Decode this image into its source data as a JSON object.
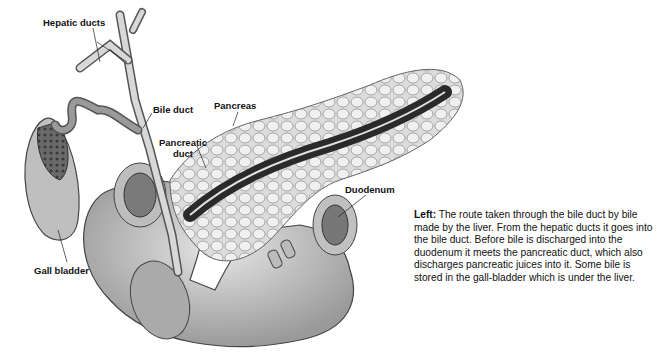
{
  "labels": {
    "hepatic_ducts": "Hepatic ducts",
    "bile_duct": "Bile duct",
    "pancreas": "Pancreas",
    "pancreatic_duct_line1": "Pancreatic",
    "pancreatic_duct_line2": "duct",
    "duodenum": "Duodenum",
    "gall_bladder": "Gall bladder"
  },
  "caption": {
    "lead": "Left:",
    "text": " The route taken through the bile duct by bile made by the liver. From the hepatic ducts it goes into the bile duct. Before bile is discharged into the duodenum it meets the pancreatic duct, which also discharges pancreatic juices into it. Some bile is stored in the gall-bladder which is under the liver."
  }
}
